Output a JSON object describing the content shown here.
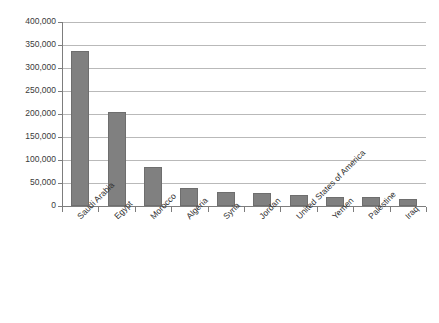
{
  "chart_data": {
    "type": "bar",
    "title": "Number of ... in Arab Countries",
    "xlabel": "",
    "ylabel": "",
    "ylim": [
      0,
      400000
    ],
    "ytick_step": 50000,
    "grid": true,
    "legend": "none",
    "orientation": "vertical",
    "bar_color": "#808080",
    "categories": [
      "Saudi Arabia",
      "Egypt",
      "Morocco",
      "Algeria",
      "Syria",
      "Jordan",
      "United States of America",
      "Yemen",
      "Palestine",
      "Iraq"
    ],
    "values": [
      338000,
      204000,
      85000,
      40000,
      30000,
      28000,
      23000,
      20000,
      19000,
      15000
    ],
    "ytick_labels": [
      "0",
      "50,000",
      "100,000",
      "150,000",
      "200,000",
      "250,000",
      "300,000",
      "350,000",
      "400,000"
    ],
    "ytick_values": [
      0,
      50000,
      100000,
      150000,
      200000,
      250000,
      300000,
      350000,
      400000
    ]
  }
}
